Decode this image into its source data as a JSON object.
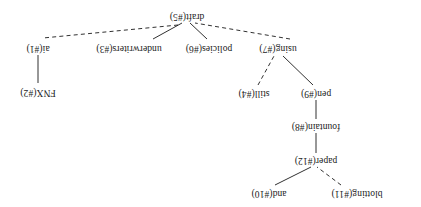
{
  "figure": {
    "kind": "dependency-tree",
    "orientation_degrees": 180,
    "background_color": "#ffffff",
    "text_color": "#1a1a1a",
    "width": 421,
    "height": 207
  },
  "nodes": [
    {
      "id": "n11",
      "label": "blotting(#11)",
      "word": "blotting",
      "index": 11,
      "x": 64,
      "y": 14
    },
    {
      "id": "n10",
      "label": "and(#10)",
      "word": "and",
      "index": 10,
      "x": 152,
      "y": 14
    },
    {
      "id": "n12",
      "label": "paper(#12)",
      "word": "paper",
      "index": 12,
      "x": 105,
      "y": 47
    },
    {
      "id": "n8",
      "label": "fountain(#8)",
      "word": "fountain",
      "index": 8,
      "x": 105,
      "y": 81
    },
    {
      "id": "n9",
      "label": "pen(#9)",
      "word": "pen",
      "index": 9,
      "x": 105,
      "y": 114
    },
    {
      "id": "n4",
      "label": "still(#4)",
      "word": "still",
      "index": 4,
      "x": 167,
      "y": 114
    },
    {
      "id": "n2",
      "label": "FNX(#2)",
      "word": "FNX",
      "index": 2,
      "x": 383,
      "y": 115
    },
    {
      "id": "n7",
      "label": "using(#7)",
      "word": "using",
      "index": 7,
      "x": 143,
      "y": 159
    },
    {
      "id": "n6",
      "label": "policies(#6)",
      "word": "policies",
      "index": 6,
      "x": 212,
      "y": 159
    },
    {
      "id": "n3",
      "label": "underwriters(#3)",
      "word": "underwriters",
      "index": 3,
      "x": 292,
      "y": 159
    },
    {
      "id": "n1",
      "label": "ai(#1)",
      "word": "ai",
      "index": 1,
      "x": 383,
      "y": 159
    },
    {
      "id": "n5",
      "label": "draft(#5)",
      "word": "draft",
      "index": 5,
      "x": 234,
      "y": 191
    }
  ],
  "edges": [
    {
      "id": "e1",
      "from": "n11",
      "to": "n12",
      "style": "dashed",
      "x1": 80,
      "y1": 22,
      "x2": 104,
      "y2": 40
    },
    {
      "id": "e2",
      "from": "n10",
      "to": "n12",
      "style": "solid",
      "x1": 146,
      "y1": 22,
      "x2": 110,
      "y2": 40
    },
    {
      "id": "e3",
      "from": "n12",
      "to": "n8",
      "style": "solid",
      "x1": 105,
      "y1": 54,
      "x2": 105,
      "y2": 74
    },
    {
      "id": "e4",
      "from": "n8",
      "to": "n9",
      "style": "solid",
      "x1": 105,
      "y1": 88,
      "x2": 105,
      "y2": 107
    },
    {
      "id": "e5",
      "from": "n9",
      "to": "n7",
      "style": "solid",
      "x1": 108,
      "y1": 122,
      "x2": 138,
      "y2": 151
    },
    {
      "id": "e6",
      "from": "n4",
      "to": "n7",
      "style": "dashed",
      "x1": 163,
      "y1": 122,
      "x2": 147,
      "y2": 151
    },
    {
      "id": "e7",
      "from": "n7",
      "to": "n5",
      "style": "dashed",
      "x1": 131,
      "y1": 168,
      "x2": 226,
      "y2": 184
    },
    {
      "id": "e8",
      "from": "n6",
      "to": "n5",
      "style": "solid",
      "x1": 214,
      "y1": 168,
      "x2": 231,
      "y2": 184
    },
    {
      "id": "e9",
      "from": "n3",
      "to": "n5",
      "style": "solid",
      "x1": 268,
      "y1": 168,
      "x2": 239,
      "y2": 184
    },
    {
      "id": "e10",
      "from": "n5",
      "to": "n1",
      "style": "dashed",
      "x1": 243,
      "y1": 182,
      "x2": 378,
      "y2": 169
    },
    {
      "id": "e11",
      "from": "n1",
      "to": "n2",
      "style": "solid",
      "x1": 383,
      "y1": 152,
      "x2": 383,
      "y2": 124
    }
  ]
}
